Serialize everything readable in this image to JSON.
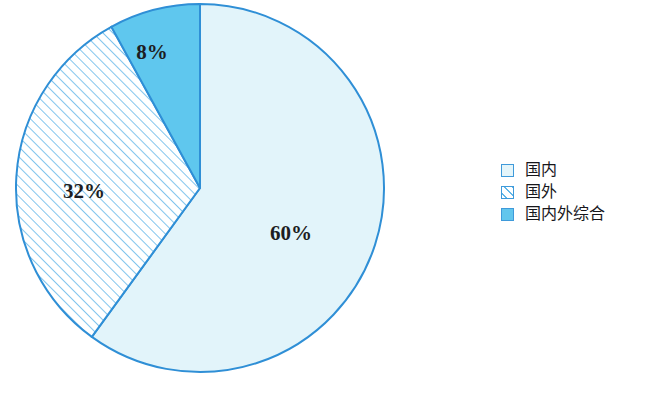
{
  "chart_data": {
    "type": "pie",
    "title": "",
    "subtitle": "",
    "xlabel": "",
    "ylabel": "",
    "categories": [
      "国内",
      "国外",
      "国内外综合"
    ],
    "values": [
      60,
      32,
      8
    ],
    "data_labels": [
      "60%",
      "32%",
      "8%"
    ],
    "units": "percent",
    "total": 100,
    "start_angle_deg": 0,
    "direction": "clockwise",
    "legend_position": "right",
    "grid": false,
    "slices": [
      {
        "label": "国内",
        "value": 60,
        "data_label": "60%",
        "start_deg": 0,
        "end_deg": 216,
        "fill": "#e2f4fa",
        "pattern": "solid",
        "stroke": "#2f8fd6",
        "label_x": 291,
        "label_y": 240
      },
      {
        "label": "国外",
        "value": 32,
        "data_label": "32%",
        "start_deg": 216,
        "end_deg": 331.2,
        "fill": "#ffffff",
        "pattern": "diagonal-hatch-45",
        "pattern_color": "#6cbbea",
        "stroke": "#2f8fd6",
        "label_x": 84,
        "label_y": 198
      },
      {
        "label": "国内外综合",
        "value": 8,
        "data_label": "8%",
        "start_deg": 331.2,
        "end_deg": 360,
        "fill": "#5fc7ee",
        "pattern": "solid",
        "stroke": "#2f8fd6",
        "label_x": 152,
        "label_y": 59
      }
    ],
    "geometry": {
      "center_x": 200,
      "center_y": 188,
      "radius": 184
    },
    "colors": {
      "domestic": "#e2f4fa",
      "overseas_hatch": "#6cbbea",
      "combined": "#5fc7ee",
      "outline": "#2f8fd6",
      "label_text": "#1d1d22",
      "background": "#ffffff"
    }
  },
  "legend": {
    "items": [
      {
        "label": "国内",
        "swatch": "solid-pale"
      },
      {
        "label": "国外",
        "swatch": "hatched"
      },
      {
        "label": "国内外综合",
        "swatch": "solid-blue"
      }
    ]
  }
}
